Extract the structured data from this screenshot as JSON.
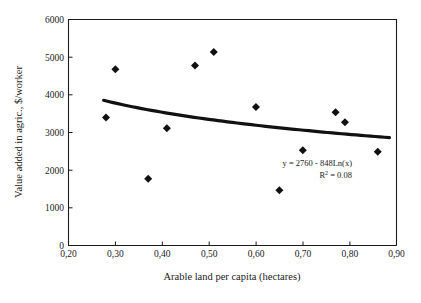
{
  "chart_data": {
    "type": "scatter",
    "title": "",
    "xlabel": "Arable land per capita (hectares)",
    "ylabel": "Value added in agric., $/worker",
    "xlim": [
      0.2,
      0.9
    ],
    "ylim": [
      0,
      6000
    ],
    "xticks": [
      "0,20",
      "0,30",
      "0,40",
      "0,50",
      "0,60",
      "0,70",
      "0,80",
      "0,90"
    ],
    "xtick_values": [
      0.2,
      0.3,
      0.4,
      0.5,
      0.6,
      0.7,
      0.8,
      0.9
    ],
    "yticks": [
      "0",
      "1000",
      "2000",
      "3000",
      "4000",
      "5000",
      "6000"
    ],
    "ytick_values": [
      0,
      1000,
      2000,
      3000,
      4000,
      5000,
      6000
    ],
    "grid": false,
    "legend": false,
    "decimal_separator": ",",
    "marker_style": "filled-diamond",
    "marker_color": "#111111",
    "points": [
      {
        "x": 0.28,
        "y": 3400
      },
      {
        "x": 0.3,
        "y": 4680
      },
      {
        "x": 0.37,
        "y": 1770
      },
      {
        "x": 0.41,
        "y": 3110
      },
      {
        "x": 0.47,
        "y": 4780
      },
      {
        "x": 0.51,
        "y": 5140
      },
      {
        "x": 0.6,
        "y": 3680
      },
      {
        "x": 0.65,
        "y": 1470
      },
      {
        "x": 0.7,
        "y": 2530
      },
      {
        "x": 0.77,
        "y": 3540
      },
      {
        "x": 0.79,
        "y": 3270
      },
      {
        "x": 0.86,
        "y": 2490
      }
    ],
    "trendline": {
      "type": "logarithmic",
      "intercept": 2760,
      "coefficient": -848,
      "equation_label": "y = 2760 - 848Ln(x)",
      "r2_label_prefix": "R",
      "r2_label_sup": "2",
      "r2_label_value": " = 0.08",
      "r2": 0.08,
      "color": "#111111",
      "x_start": 0.275,
      "x_end": 0.885
    },
    "annotations": [
      {
        "text": "y = 2760 - 848Ln(x)",
        "x": 0.735,
        "y": 2040
      },
      {
        "text": "R2 = 0.08",
        "x": 0.765,
        "y": 1750
      }
    ]
  }
}
